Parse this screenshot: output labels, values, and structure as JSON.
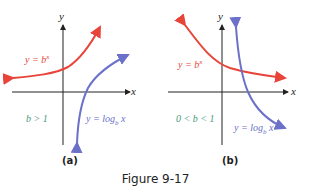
{
  "figure": {
    "caption": "Figure 9-17",
    "colors": {
      "exp_curve": "#e8443a",
      "log_curve": "#6b70c8",
      "axis": "#222222",
      "condition_text": "#4a9a7a",
      "exp_label": "#e8443a",
      "log_label": "#6b70c8"
    },
    "panels": [
      {
        "id": "a",
        "label": "(a)",
        "x_axis_label": "x",
        "y_axis_label": "y",
        "exp_label": "y = b",
        "exp_sup": "x",
        "log_label": "y = log",
        "log_sub": "b",
        "log_var": "x",
        "condition": "b > 1"
      },
      {
        "id": "b",
        "label": "(b)",
        "x_axis_label": "x",
        "y_axis_label": "y",
        "exp_label": "y = b",
        "exp_sup": "x",
        "log_label": "y = log",
        "log_sub": "b",
        "log_var": "x",
        "condition": "0 < b < 1"
      }
    ]
  }
}
